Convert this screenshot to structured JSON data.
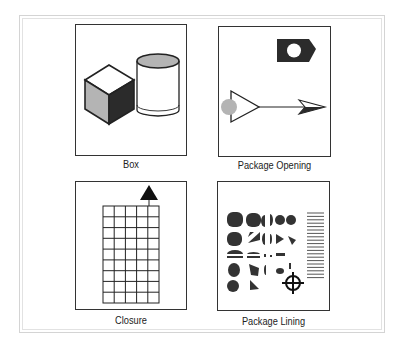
{
  "figure": {
    "panels": [
      {
        "id": "box",
        "label": "Box",
        "icon": "cube-and-cylinder-icon"
      },
      {
        "id": "package-opening",
        "label": "Package Opening",
        "icon": "opening-arrow-icon"
      },
      {
        "id": "closure",
        "label": "Closure",
        "icon": "grid-with-triangle-icon"
      },
      {
        "id": "package-lining",
        "label": "Package Lining",
        "icon": "dot-pattern-crosshair-icon"
      }
    ],
    "colors": {
      "stroke": "#222222",
      "dark_fill": "#2b2b2b",
      "gray_fill": "#b4b4b4",
      "frame_border": "#d4d4d4"
    },
    "closure_grid": {
      "columns": 5,
      "rows": 9
    },
    "lining_lines_count": 20
  }
}
